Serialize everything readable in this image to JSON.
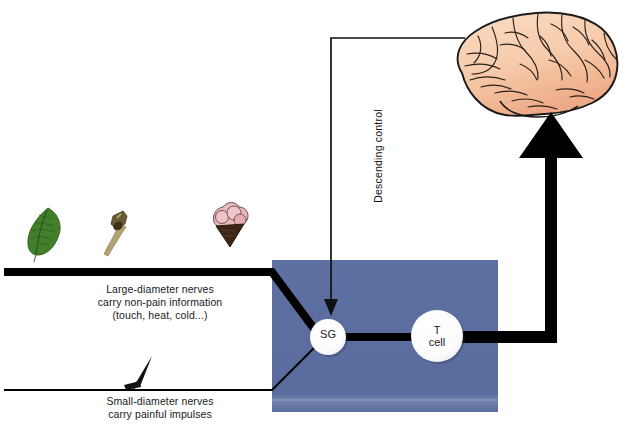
{
  "figure": {
    "background_color": "#ffffff"
  },
  "colors": {
    "spinal_box": "#5d6fa0",
    "spinal_box_shade": "#6d7daa",
    "nerve_black": "#000000",
    "brain_fill": "#f6cfae",
    "brain_outline": "#1a1a1a",
    "leaf_green": "#3f7a2a",
    "brush_handle": "#b0a070",
    "brush_tip": "#4a3a22",
    "icecream_scoop": "#e8b8bd",
    "icecream_cone": "#3a2416",
    "node_fill": "#ffffff",
    "node_shadow": "#2b3354"
  },
  "captions": {
    "large_fiber": "Large-diameter nerves\ncarry non-pain information\n(touch, heat, cold...)",
    "small_fiber": "Small-diameter nerves\ncarry painful impulses",
    "descending": "Descending control"
  },
  "nodes": [
    {
      "id": "sg",
      "label": "SG",
      "cx": 328,
      "cy": 337,
      "r": 18
    },
    {
      "id": "tcell",
      "label": "T\ncell",
      "cx": 437,
      "cy": 336,
      "r": 26
    }
  ],
  "stimulus_icons": [
    {
      "name": "leaf-icon",
      "label": "leaf",
      "x": 30,
      "y": 212
    },
    {
      "name": "brush-icon",
      "label": "brush",
      "x": 103,
      "y": 208
    },
    {
      "name": "ice-cream-icon",
      "label": "ice cream cone",
      "x": 172,
      "y": 205
    },
    {
      "name": "pin-icon",
      "label": "pin / needle",
      "x": 130,
      "y": 365
    }
  ],
  "pathways": [
    {
      "name": "large-diameter-afferent",
      "description": "Thick black line entering from left at y=272 into SG"
    },
    {
      "name": "small-diameter-afferent",
      "description": "Thin black line entering from left at y=390 into SG"
    },
    {
      "name": "sg-to-tcell",
      "description": "Thick black connection from SG to T cell"
    },
    {
      "name": "ascending-output",
      "description": "Thick black arrow from T cell right then up to brain"
    },
    {
      "name": "descending-control",
      "description": "Thin line from brain left then down into spinal box, arrowhead at top of SG"
    }
  ],
  "brain": {
    "name": "brain-illustration",
    "label": "Brain (lateral view)"
  },
  "spinal_box": {
    "name": "spinal-cord-dorsal-horn-box",
    "label": "Spinal cord dorsal horn",
    "x": 272,
    "y": 260,
    "width": 226,
    "height": 152
  }
}
